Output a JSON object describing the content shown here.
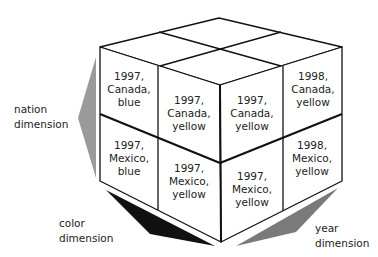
{
  "diagram": {
    "type": "olap-data-cube",
    "cells": {
      "left_top": [
        "1997,",
        "Canada,",
        "blue"
      ],
      "left_top_2": [
        "1997,",
        "Canada,",
        "yellow"
      ],
      "right_top_1": [
        "1997,",
        "Canada,",
        "yellow"
      ],
      "right_top_2": [
        "1998,",
        "Canada,",
        "yellow"
      ],
      "left_bot": [
        "1997,",
        "Mexico,",
        "blue"
      ],
      "left_bot_2": [
        "1997,",
        "Mexico,",
        "yellow"
      ],
      "right_bot_1": [
        "1997,",
        "Mexico,",
        "yellow"
      ],
      "right_bot_2": [
        "1998,",
        "Mexico,",
        "yellow"
      ]
    },
    "axes": {
      "nation": [
        "nation",
        "dimension"
      ],
      "color": [
        "color",
        "dimension"
      ],
      "year": [
        "year",
        "dimension"
      ]
    },
    "colors": {
      "nation_arrow": "#9a9a9a",
      "color_arrow": "#111111",
      "year_arrow": "#7a7a7a",
      "edge": "#111111"
    }
  }
}
